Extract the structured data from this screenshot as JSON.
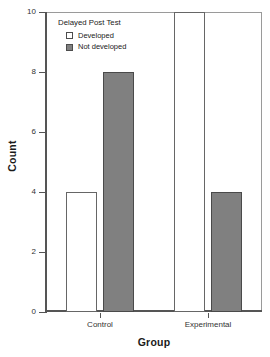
{
  "chart_data": {
    "type": "bar",
    "title": "",
    "subtitle": "",
    "xlabel": "Group",
    "ylabel": "Count",
    "categories": [
      "Control",
      "Experimental"
    ],
    "series": [
      {
        "name": "Developed",
        "values": [
          4,
          10
        ],
        "color": "#ffffff",
        "swatch": "developed"
      },
      {
        "name": "Not developed",
        "values": [
          8,
          4
        ],
        "color": "#808080",
        "swatch": "notdeveloped"
      }
    ],
    "ylim": [
      0,
      10
    ],
    "yticks": [
      0,
      2,
      4,
      6,
      8,
      10
    ],
    "ytick_labels": [
      "0",
      "2",
      "4",
      "6",
      "8",
      "10"
    ],
    "grid": false,
    "legend": {
      "title": "Delayed Post Test",
      "position": "inside-top-left",
      "entries": [
        {
          "label": "Developed",
          "swatch": "developed"
        },
        {
          "label": "Not developed",
          "swatch": "notdeveloped"
        }
      ]
    },
    "annotations": []
  },
  "colors": {
    "developed_fill": "#ffffff",
    "not_developed_fill": "#808080",
    "bar_outline": "#4d4d4d",
    "axis": "#555555",
    "frame": "#8a8a8a",
    "text": "#222222",
    "background": "#ffffff"
  }
}
